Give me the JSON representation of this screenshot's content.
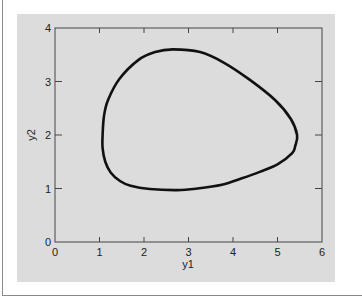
{
  "chart_data": {
    "type": "line",
    "title": "",
    "xlabel": "y1",
    "ylabel": "y2",
    "xlim": [
      0,
      6
    ],
    "ylim": [
      0,
      4
    ],
    "grid": false,
    "legend": null,
    "xticks": [
      "0",
      "1",
      "2",
      "3",
      "4",
      "5",
      "6"
    ],
    "yticks": [
      "0",
      "1",
      "2",
      "3",
      "4"
    ],
    "series": [
      {
        "name": "phase-plane trajectory",
        "closed": true,
        "color": "#111111",
        "points": [
          [
            2.65,
            3.6
          ],
          [
            3.26,
            3.55
          ],
          [
            3.8,
            3.35
          ],
          [
            4.38,
            3.03
          ],
          [
            4.95,
            2.65
          ],
          [
            5.3,
            2.3
          ],
          [
            5.44,
            2.0
          ],
          [
            5.4,
            1.8
          ],
          [
            5.33,
            1.66
          ],
          [
            5.0,
            1.45
          ],
          [
            4.6,
            1.31
          ],
          [
            4.2,
            1.19
          ],
          [
            3.75,
            1.07
          ],
          [
            3.2,
            1.0
          ],
          [
            2.75,
            0.97
          ],
          [
            2.13,
            0.99
          ],
          [
            1.7,
            1.05
          ],
          [
            1.46,
            1.14
          ],
          [
            1.25,
            1.3
          ],
          [
            1.13,
            1.5
          ],
          [
            1.07,
            1.75
          ],
          [
            1.07,
            2.0
          ],
          [
            1.1,
            2.35
          ],
          [
            1.19,
            2.65
          ],
          [
            1.45,
            3.05
          ],
          [
            1.87,
            3.4
          ],
          [
            2.25,
            3.55
          ]
        ]
      }
    ]
  },
  "colors": {
    "panel_background": "#dcdcdc",
    "axis": "#444444",
    "curve": "#111111"
  }
}
